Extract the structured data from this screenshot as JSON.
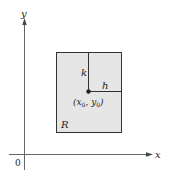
{
  "diagram": {
    "axes": {
      "x_label": "x",
      "y_label": "y",
      "origin_label": "0"
    },
    "region": {
      "label": "R",
      "fill": "#e6e6e6",
      "stroke": "#333333"
    },
    "point": {
      "label_open": "(x",
      "sub0": "0",
      "sep": ", y",
      "sub1": "0",
      "label_close": ")"
    },
    "segments": {
      "vertical_label": "k",
      "horizontal_label": "h"
    },
    "colors": {
      "axis": "#555555",
      "point": "#222222"
    }
  }
}
